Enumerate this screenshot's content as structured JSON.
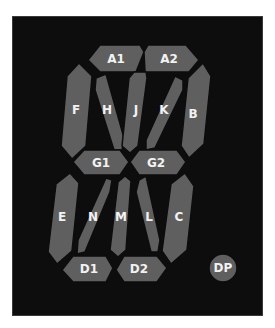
{
  "diagram": {
    "colors": {
      "background": "#ffffff",
      "panel": "#0d0d0d",
      "segment": "#5f5f5f",
      "label": "#f2f2f2"
    },
    "segments": {
      "A1": {
        "label": "A1"
      },
      "A2": {
        "label": "A2"
      },
      "B": {
        "label": "B"
      },
      "C": {
        "label": "C"
      },
      "D1": {
        "label": "D1"
      },
      "D2": {
        "label": "D2"
      },
      "E": {
        "label": "E"
      },
      "F": {
        "label": "F"
      },
      "G1": {
        "label": "G1"
      },
      "G2": {
        "label": "G2"
      },
      "H": {
        "label": "H"
      },
      "J": {
        "label": "J"
      },
      "K": {
        "label": "K"
      },
      "L": {
        "label": "L"
      },
      "M": {
        "label": "M"
      },
      "N": {
        "label": "N"
      },
      "DP": {
        "label": "DP"
      }
    }
  }
}
